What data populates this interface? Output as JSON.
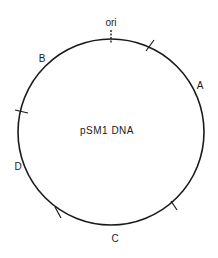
{
  "diagram": {
    "title": "pSM1 DNA",
    "type": "circular plasmid restriction map",
    "origin_label": "ori",
    "fragments": [
      {
        "label": "A"
      },
      {
        "label": "B"
      },
      {
        "label": "C"
      },
      {
        "label": "D"
      }
    ],
    "colors": {
      "line": "#1a1a1a",
      "background": "#ffffff"
    }
  }
}
